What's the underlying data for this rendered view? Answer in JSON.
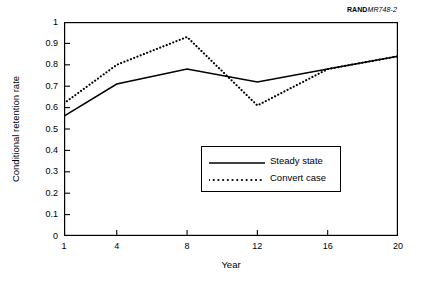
{
  "source": {
    "rand_mark": "RAND",
    "report_mark": "MR748-2"
  },
  "chart_data": {
    "type": "line",
    "title": "",
    "xlabel": "Year",
    "ylabel": "Conditional retention rate",
    "xlim": [
      1,
      20
    ],
    "ylim": [
      0,
      1
    ],
    "grid": false,
    "legend_position": "center",
    "xticks": [
      "1",
      "4",
      "8",
      "12",
      "16",
      "20"
    ],
    "xtick_values": [
      1,
      4,
      8,
      12,
      16,
      20
    ],
    "yticks": [
      "0",
      "0.1",
      "0.2",
      "0.3",
      "0.4",
      "0.5",
      "0.6",
      "0.7",
      "0.8",
      "0.9",
      "1"
    ],
    "ytick_values": [
      0,
      0.1,
      0.2,
      0.3,
      0.4,
      0.5,
      0.6,
      0.7,
      0.8,
      0.9,
      1
    ],
    "x": [
      1,
      4,
      8,
      12,
      16,
      20
    ],
    "series": [
      {
        "name": "Steady state",
        "style": "solid",
        "color": "#000000",
        "values": [
          0.56,
          0.71,
          0.78,
          0.72,
          0.78,
          0.84
        ]
      },
      {
        "name": "Convert case",
        "style": "dotted",
        "color": "#000000",
        "values": [
          0.62,
          0.8,
          0.93,
          0.61,
          0.78,
          0.84
        ]
      }
    ]
  },
  "legend": {
    "items": [
      {
        "label": "Steady state",
        "style": "solid"
      },
      {
        "label": "Convert case",
        "style": "dotted"
      }
    ]
  },
  "colors": {
    "axis": "#000000",
    "background": "#ffffff",
    "line": "#000000"
  }
}
